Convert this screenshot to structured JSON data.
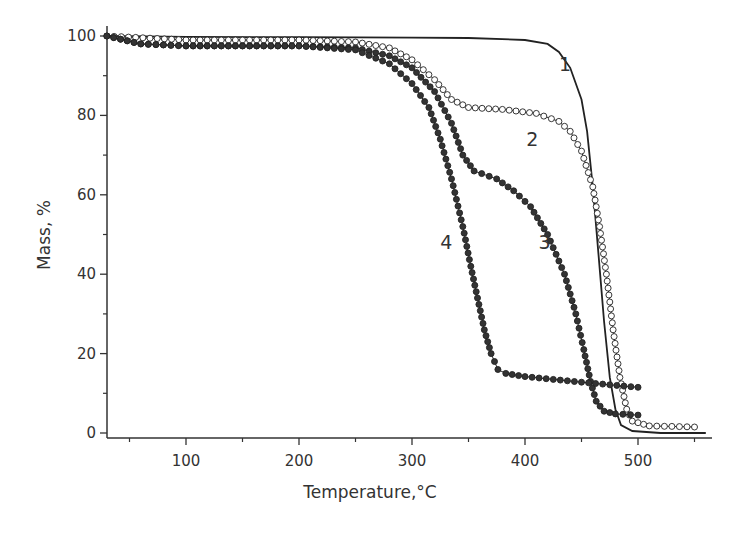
{
  "chart_data": {
    "type": "line",
    "title": "",
    "xlabel": "Temperature,°C",
    "ylabel": "Mass, %",
    "xlim": [
      30,
      560
    ],
    "ylim": [
      0,
      100
    ],
    "grid": false,
    "legend": "none (curves labeled inline 1-4)",
    "x_ticks": [
      100,
      200,
      300,
      400,
      500
    ],
    "x_minor_ticks": [
      50,
      150,
      250,
      350,
      450,
      550
    ],
    "y_ticks": [
      0,
      20,
      40,
      60,
      80,
      100
    ],
    "y_minor_ticks": [
      10,
      30,
      50,
      70,
      90
    ],
    "series": [
      {
        "name": "1",
        "marker": "none",
        "label_pos": [
          430,
          93
        ],
        "points": [
          [
            30,
            100
          ],
          [
            100,
            99.8
          ],
          [
            200,
            99.7
          ],
          [
            300,
            99.6
          ],
          [
            350,
            99.5
          ],
          [
            400,
            99
          ],
          [
            420,
            98
          ],
          [
            430,
            96
          ],
          [
            440,
            92
          ],
          [
            450,
            84
          ],
          [
            455,
            76
          ],
          [
            460,
            62
          ],
          [
            465,
            45
          ],
          [
            470,
            28
          ],
          [
            475,
            14
          ],
          [
            480,
            6
          ],
          [
            485,
            2
          ],
          [
            495,
            0.5
          ],
          [
            520,
            0
          ],
          [
            560,
            0
          ]
        ]
      },
      {
        "name": "2",
        "marker": "open-circle",
        "label_pos": [
          401,
          74
        ],
        "points": [
          [
            30,
            100
          ],
          [
            100,
            99
          ],
          [
            200,
            99
          ],
          [
            250,
            98.5
          ],
          [
            280,
            97
          ],
          [
            300,
            94
          ],
          [
            320,
            89
          ],
          [
            335,
            84
          ],
          [
            350,
            82
          ],
          [
            380,
            81.5
          ],
          [
            410,
            80.5
          ],
          [
            430,
            78.5
          ],
          [
            440,
            76
          ],
          [
            450,
            71
          ],
          [
            460,
            62
          ],
          [
            466,
            52
          ],
          [
            472,
            40
          ],
          [
            478,
            26
          ],
          [
            484,
            14
          ],
          [
            490,
            6
          ],
          [
            495,
            3
          ],
          [
            510,
            1.8
          ],
          [
            550,
            1.5
          ]
        ]
      },
      {
        "name": "3",
        "marker": "filled-circle",
        "label_pos": [
          412,
          48
        ],
        "points": [
          [
            30,
            100
          ],
          [
            60,
            98
          ],
          [
            100,
            97.5
          ],
          [
            200,
            97.5
          ],
          [
            250,
            97
          ],
          [
            280,
            95
          ],
          [
            300,
            92
          ],
          [
            320,
            86
          ],
          [
            335,
            78
          ],
          [
            345,
            70
          ],
          [
            355,
            66
          ],
          [
            375,
            64
          ],
          [
            390,
            61
          ],
          [
            405,
            57
          ],
          [
            420,
            50
          ],
          [
            435,
            40
          ],
          [
            445,
            30
          ],
          [
            452,
            21
          ],
          [
            458,
            13
          ],
          [
            463,
            8
          ],
          [
            470,
            5.5
          ],
          [
            480,
            4.8
          ],
          [
            500,
            4.5
          ]
        ]
      },
      {
        "name": "4",
        "marker": "filled-circle",
        "label_pos": [
          325,
          48
        ],
        "points": [
          [
            30,
            100
          ],
          [
            60,
            98
          ],
          [
            100,
            97.5
          ],
          [
            200,
            97.5
          ],
          [
            250,
            96.5
          ],
          [
            280,
            93
          ],
          [
            300,
            88
          ],
          [
            315,
            82
          ],
          [
            325,
            74
          ],
          [
            335,
            64
          ],
          [
            345,
            52
          ],
          [
            352,
            42
          ],
          [
            358,
            34
          ],
          [
            364,
            26
          ],
          [
            370,
            20
          ],
          [
            376,
            16
          ],
          [
            383,
            15
          ],
          [
            400,
            14.2
          ],
          [
            450,
            12.8
          ],
          [
            500,
            11.5
          ]
        ]
      }
    ]
  }
}
